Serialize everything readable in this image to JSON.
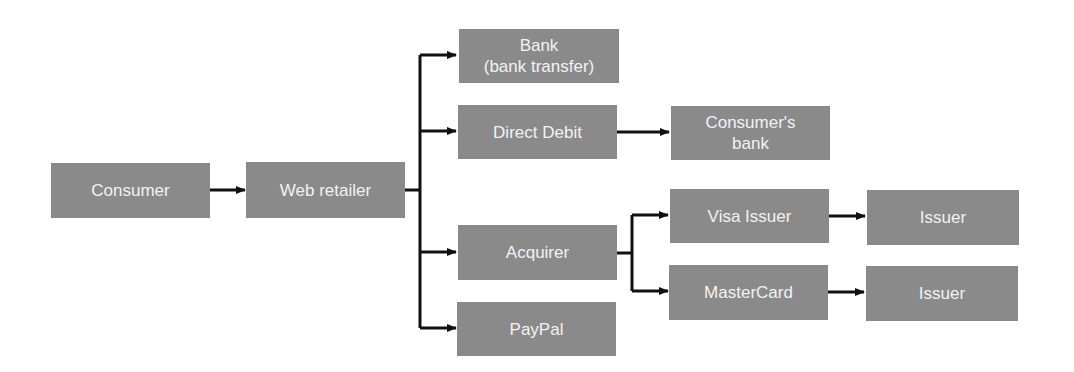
{
  "diagram": {
    "type": "flowchart",
    "colors": {
      "box_fill": "#8a8a8a",
      "box_text": "#f2f2f2",
      "connector": "#111111",
      "background": "#ffffff"
    },
    "nodes": {
      "consumer": {
        "label": "Consumer"
      },
      "web_retailer": {
        "label": "Web retailer"
      },
      "bank": {
        "label": "Bank\n(bank transfer)",
        "line1": "Bank",
        "line2": "(bank transfer)"
      },
      "direct_debit": {
        "label": "Direct Debit"
      },
      "consumers_bank": {
        "label": "Consumer's\nbank",
        "line1": "Consumer's",
        "line2": "bank"
      },
      "acquirer": {
        "label": "Acquirer"
      },
      "paypal": {
        "label": "PayPal"
      },
      "visa_issuer": {
        "label": "Visa Issuer"
      },
      "mastercard": {
        "label": "MasterCard"
      },
      "issuer_visa": {
        "label": "Issuer"
      },
      "issuer_mastercard": {
        "label": "Issuer"
      }
    },
    "edges": [
      [
        "Consumer",
        "Web retailer"
      ],
      [
        "Web retailer",
        "Bank (bank transfer)"
      ],
      [
        "Web retailer",
        "Direct Debit"
      ],
      [
        "Web retailer",
        "Acquirer"
      ],
      [
        "Web retailer",
        "PayPal"
      ],
      [
        "Direct Debit",
        "Consumer's bank"
      ],
      [
        "Acquirer",
        "Visa Issuer"
      ],
      [
        "Acquirer",
        "MasterCard"
      ],
      [
        "Visa Issuer",
        "Issuer"
      ],
      [
        "MasterCard",
        "Issuer"
      ]
    ]
  }
}
